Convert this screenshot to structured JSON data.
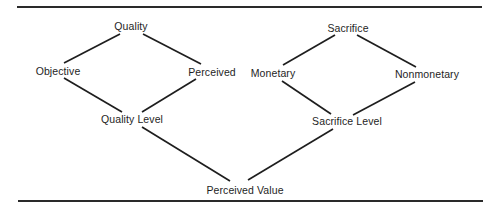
{
  "diagram": {
    "type": "hierarchy",
    "nodes": {
      "quality": "Quality",
      "objective": "Objective",
      "perceived": "Perceived",
      "quality_level": "Quality Level",
      "sacrifice": "Sacrifice",
      "monetary": "Monetary",
      "nonmonetary": "Nonmonetary",
      "sacrifice_level": "Sacrifice Level",
      "perceived_value": "Perceived Value"
    },
    "edges": [
      [
        "Quality",
        "Objective"
      ],
      [
        "Quality",
        "Perceived"
      ],
      [
        "Objective",
        "Quality Level"
      ],
      [
        "Perceived",
        "Quality Level"
      ],
      [
        "Sacrifice",
        "Monetary"
      ],
      [
        "Sacrifice",
        "Nonmonetary"
      ],
      [
        "Monetary",
        "Sacrifice Level"
      ],
      [
        "Nonmonetary",
        "Sacrifice Level"
      ],
      [
        "Quality Level",
        "Perceived Value"
      ],
      [
        "Sacrifice Level",
        "Perceived Value"
      ]
    ],
    "colors": {
      "line": "#1e1e1e",
      "text": "#1e1e1e",
      "background": "#ffffff"
    }
  }
}
